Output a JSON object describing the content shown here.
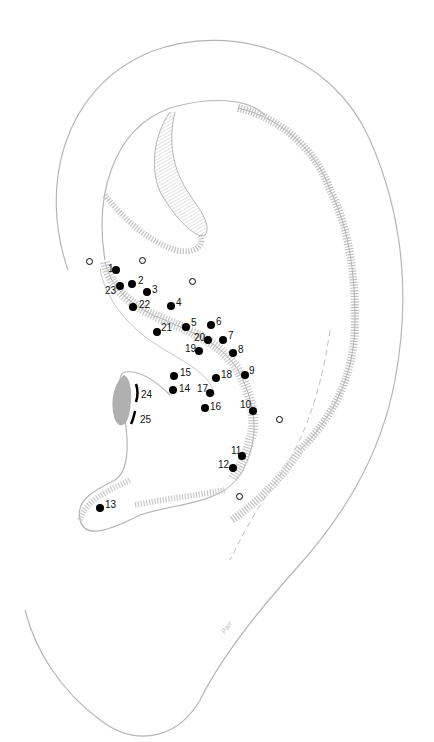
{
  "figure": {
    "colors": {
      "outline": "#b5b5b5",
      "hatch": "#c8c8c8",
      "shade": "#b0b0b0",
      "point": "#000000"
    },
    "signature": "Parr"
  },
  "filled_points": [
    {
      "label": "1",
      "x": 116,
      "y": 270,
      "lx": -8,
      "ly": -6
    },
    {
      "label": "2",
      "x": 132,
      "y": 284,
      "lx": 6,
      "ly": -8
    },
    {
      "label": "3",
      "x": 147,
      "y": 292,
      "lx": 5,
      "ly": -7
    },
    {
      "label": "4",
      "x": 171,
      "y": 306,
      "lx": 5,
      "ly": -8
    },
    {
      "label": "5",
      "x": 186,
      "y": 327,
      "lx": 5,
      "ly": -9
    },
    {
      "label": "6",
      "x": 211,
      "y": 325,
      "lx": 5,
      "ly": -8
    },
    {
      "label": "7",
      "x": 223,
      "y": 340,
      "lx": 5,
      "ly": -9
    },
    {
      "label": "8",
      "x": 233,
      "y": 353,
      "lx": 5,
      "ly": -8
    },
    {
      "label": "9",
      "x": 245,
      "y": 375,
      "lx": 4,
      "ly": -9
    },
    {
      "label": "10",
      "x": 253,
      "y": 411,
      "lx": -13,
      "ly": -11
    },
    {
      "label": "11",
      "x": 242,
      "y": 456,
      "lx": -11,
      "ly": -10
    },
    {
      "label": "12",
      "x": 233,
      "y": 468,
      "lx": -15,
      "ly": -8
    },
    {
      "label": "13",
      "x": 100,
      "y": 508,
      "lx": 5,
      "ly": -8
    },
    {
      "label": "14",
      "x": 173,
      "y": 390,
      "lx": 6,
      "ly": -6
    },
    {
      "label": "15",
      "x": 174,
      "y": 376,
      "lx": 6,
      "ly": -8
    },
    {
      "label": "16",
      "x": 205,
      "y": 408,
      "lx": 5,
      "ly": -6
    },
    {
      "label": "17",
      "x": 210,
      "y": 393,
      "lx": -13,
      "ly": -9
    },
    {
      "label": "18",
      "x": 216,
      "y": 378,
      "lx": 5,
      "ly": -8
    },
    {
      "label": "19",
      "x": 199,
      "y": 351,
      "lx": -14,
      "ly": -7
    },
    {
      "label": "20",
      "x": 208,
      "y": 340,
      "lx": -14,
      "ly": -7
    },
    {
      "label": "21",
      "x": 157,
      "y": 332,
      "lx": 4,
      "ly": -9
    },
    {
      "label": "22",
      "x": 133,
      "y": 307,
      "lx": 6,
      "ly": -7
    },
    {
      "label": "23",
      "x": 120,
      "y": 286,
      "lx": -15,
      "ly": 0
    }
  ],
  "open_points": [
    {
      "x": 90,
      "y": 262
    },
    {
      "x": 143,
      "y": 261
    },
    {
      "x": 193,
      "y": 282
    },
    {
      "x": 280,
      "y": 420
    },
    {
      "x": 240,
      "y": 497
    }
  ],
  "arc_marks": [
    {
      "label": "24",
      "lx": 141,
      "ly": 390
    },
    {
      "label": "25",
      "lx": 140,
      "ly": 415
    }
  ]
}
